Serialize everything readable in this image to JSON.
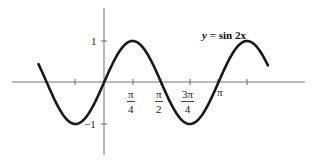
{
  "title": "y = sin 2x",
  "equation": {
    "lhs": "y",
    "eq": "=",
    "rhs": "sin 2x"
  },
  "colors": {
    "curve": "#1a1a1a",
    "axis": "#777777",
    "text": "#222222",
    "background": "#ffffff"
  },
  "y_ticks": [
    {
      "label": "1",
      "value": 1
    },
    {
      "label": "−1",
      "value": -1
    }
  ],
  "x_ticks": [
    {
      "num": "π",
      "den": "4",
      "value": "π/4"
    },
    {
      "num": "π",
      "den": "2",
      "value": "π/2"
    },
    {
      "num": "3π",
      "den": "4",
      "value": "3π/4"
    },
    {
      "label": "π",
      "value": "π"
    }
  ],
  "chart_data": {
    "type": "line",
    "title": "y = sin 2x",
    "xlabel": "",
    "ylabel": "",
    "series": [
      {
        "name": "y = sin 2x",
        "function": "sin(2x)",
        "x_range": [
          -1.8,
          4.5
        ],
        "x": [
          -1.8,
          -1.5708,
          -1.1781,
          -0.7854,
          -0.3927,
          0,
          0.3927,
          0.7854,
          1.1781,
          1.5708,
          1.9635,
          2.3562,
          2.7489,
          3.1416,
          3.5343,
          3.927,
          4.3197,
          4.5
        ],
        "y": [
          0.44,
          0,
          -0.71,
          -1,
          -0.71,
          0,
          0.71,
          1,
          0.71,
          0,
          -0.71,
          -1,
          -0.71,
          0,
          0.71,
          1,
          0.71,
          0.41
        ]
      }
    ],
    "x_tick_labels": [
      "π/4",
      "π/2",
      "3π/4",
      "π"
    ],
    "x_tick_values": [
      0.7854,
      1.5708,
      2.3562,
      3.1416
    ],
    "unlabeled_x_ticks": [
      -0.7854,
      3.927
    ],
    "y_tick_labels": [
      "1",
      "−1"
    ],
    "y_tick_values": [
      1,
      -1
    ],
    "ylim": [
      -1.9,
      1.8
    ],
    "grid": false,
    "legend": "none (equation annotation top-right)"
  }
}
